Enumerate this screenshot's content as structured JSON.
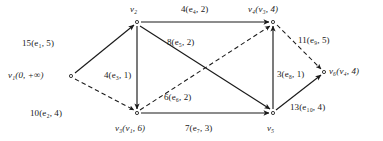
{
  "figure": {
    "type": "directed-weighted-graph-diagram",
    "width": 383,
    "height": 141,
    "background_color": "#ffffff",
    "stroke_color": "#1a1a1a",
    "text_color": "#1a1a1a"
  },
  "graph_data": {
    "type": "diagram",
    "nodes": [
      {
        "id": "v1",
        "label": "v₁(0, +∞)",
        "name": "v₁",
        "state": "(0, +∞)",
        "x": 71,
        "y": 76,
        "label_x": 8,
        "label_y": 71,
        "label_anchor": "left"
      },
      {
        "id": "v2",
        "label": "v₂",
        "name": "v₂",
        "state": "",
        "x": 137,
        "y": 22,
        "label_x": 130,
        "label_y": 5,
        "label_anchor": "left"
      },
      {
        "id": "v3",
        "label": "v₃(v₁, 6)",
        "name": "v₃",
        "state": "(v₁, 6)",
        "x": 137,
        "y": 113,
        "label_x": 115,
        "label_y": 124,
        "label_anchor": "left"
      },
      {
        "id": "v4",
        "label": "v₄(v₃, 4)",
        "name": "v₄",
        "state": "(v₃, 4)",
        "x": 273,
        "y": 22,
        "label_x": 248,
        "label_y": 5,
        "label_anchor": "left"
      },
      {
        "id": "v5",
        "label": "v₅",
        "name": "v₅",
        "state": "",
        "x": 273,
        "y": 113,
        "label_x": 267,
        "label_y": 124,
        "label_anchor": "left"
      },
      {
        "id": "v6",
        "label": "v₆(v₄, 4)",
        "name": "v₆",
        "state": "(v₄, 4)",
        "x": 324,
        "y": 72,
        "label_x": 329,
        "label_y": 67,
        "label_anchor": "left"
      }
    ],
    "edges": [
      {
        "id": "e1",
        "from": "v1",
        "to": "v2",
        "style": "solid",
        "label": "15(e₁, 5)",
        "weight": 15,
        "edge_name": "e₁",
        "cost": 5,
        "label_x": 22,
        "label_y": 39
      },
      {
        "id": "e2",
        "from": "v1",
        "to": "v3",
        "style": "dashed",
        "label": "10(e₂, 4)",
        "weight": 10,
        "edge_name": "e₂",
        "cost": 4,
        "label_x": 30,
        "label_y": 109
      },
      {
        "id": "e3",
        "from": "v2",
        "to": "v3",
        "style": "solid",
        "label": "4(e₃, 1)",
        "weight": 4,
        "edge_name": "e₃",
        "cost": 1,
        "label_x": 104,
        "label_y": 71
      },
      {
        "id": "e4",
        "from": "v2",
        "to": "v4",
        "style": "solid",
        "label": "4(e₄, 2)",
        "weight": 4,
        "edge_name": "e₄",
        "cost": 2,
        "label_x": 181,
        "label_y": 5
      },
      {
        "id": "e5",
        "from": "v2",
        "to": "v5",
        "style": "solid",
        "label": "8(e₅, 2)",
        "weight": 8,
        "edge_name": "e₅",
        "cost": 2,
        "label_x": 167,
        "label_y": 38
      },
      {
        "id": "e6",
        "from": "v3",
        "to": "v4",
        "style": "dashed",
        "label": "6(e₆, 2)",
        "weight": 6,
        "edge_name": "e₆",
        "cost": 2,
        "label_x": 164,
        "label_y": 93
      },
      {
        "id": "e7",
        "from": "v3",
        "to": "v5",
        "style": "solid",
        "label": "7(e₇, 3)",
        "weight": 7,
        "edge_name": "e₇",
        "cost": 3,
        "label_x": 185,
        "label_y": 124
      },
      {
        "id": "e8",
        "from": "v5",
        "to": "v4",
        "style": "solid",
        "label": "3(e₈, 1)",
        "weight": 3,
        "edge_name": "e₈",
        "cost": 1,
        "label_x": 277,
        "label_y": 70
      },
      {
        "id": "e9",
        "from": "v4",
        "to": "v6",
        "style": "dashed",
        "label": "11(e₉, 5)",
        "weight": 11,
        "edge_name": "e₉",
        "cost": 5,
        "label_x": 298,
        "label_y": 36
      },
      {
        "id": "e10",
        "from": "v5",
        "to": "v6",
        "style": "solid",
        "label": "13(e₁₀, 4)",
        "weight": 13,
        "edge_name": "e₁₀",
        "cost": 4,
        "label_x": 290,
        "label_y": 103
      }
    ]
  }
}
